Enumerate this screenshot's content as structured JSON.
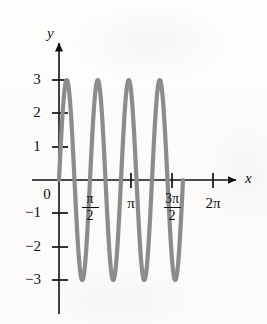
{
  "figure": {
    "background_color": "#fdfdfc",
    "curve_color": "#8c8c8c",
    "axis_color": "#111111"
  },
  "axes": {
    "x_axis_label": "x",
    "y_axis_label": "y",
    "origin_label": "0"
  },
  "y_ticks": [
    {
      "label": "3",
      "value": 3
    },
    {
      "label": "2",
      "value": 2
    },
    {
      "label": "1",
      "value": 1
    },
    {
      "label": "−1",
      "value": -1
    },
    {
      "label": "−2",
      "value": -2
    },
    {
      "label": "−3",
      "value": -3
    }
  ],
  "x_ticks": [
    {
      "numerator": "π",
      "denominator": "2",
      "label": "π/2",
      "value": 1.5708,
      "is_fraction": true
    },
    {
      "numerator": "π",
      "denominator": "",
      "label": "π",
      "value": 3.1416,
      "is_fraction": false
    },
    {
      "numerator": "3π",
      "denominator": "2",
      "label": "3π/2",
      "value": 4.7124,
      "is_fraction": true
    },
    {
      "numerator": "2π",
      "denominator": "",
      "label": "2π",
      "value": 6.2832,
      "is_fraction": false
    }
  ],
  "chart_data": {
    "type": "line",
    "title": "",
    "xlabel": "x",
    "ylabel": "y",
    "function": "y = 3 sin(4x)",
    "amplitude": 3,
    "period": 1.5708,
    "cycles_shown": 4,
    "xlim": [
      0,
      6.9
    ],
    "ylim": [
      -3.4,
      3.4
    ],
    "grid": false,
    "legend": "none",
    "xtick_labels": [
      "π/2",
      "π",
      "3π/2",
      "2π"
    ],
    "xtick_values": [
      1.5708,
      3.1416,
      4.7124,
      6.2832
    ],
    "ytick_labels": [
      "3",
      "2",
      "1",
      "−1",
      "−2",
      "−3"
    ],
    "ytick_values": [
      3,
      2,
      1,
      -1,
      -2,
      -3
    ],
    "maxima_x": [
      0.3927,
      1.9635,
      3.5343,
      5.1051
    ],
    "maxima_y": [
      3,
      3,
      3,
      3
    ],
    "minima_x": [
      1.1781,
      2.7489,
      4.3197,
      5.8905
    ],
    "minima_y": [
      -3,
      -3,
      -3,
      -3
    ],
    "zeros_x": [
      0,
      0.7854,
      1.5708,
      2.3562,
      3.1416,
      3.927,
      4.7124,
      5.4978,
      6.2832
    ],
    "series": [
      {
        "name": "y = 3 sin(4x)",
        "color": "#8c8c8c",
        "x": [
          0,
          0.1309,
          0.2618,
          0.3927,
          0.5236,
          0.6545,
          0.7854,
          0.9163,
          1.0472,
          1.1781,
          1.309,
          1.4399,
          1.5708,
          1.7017,
          1.8326,
          1.9635,
          2.0944,
          2.2253,
          2.3562,
          2.4871,
          2.618,
          2.7489,
          2.8798,
          3.0107,
          3.1416,
          3.2725,
          3.4034,
          3.5343,
          3.6652,
          3.7961,
          3.927,
          4.0579,
          4.1888,
          4.3197,
          4.4506,
          4.5815,
          4.7124,
          4.8433,
          4.9742,
          5.1051,
          5.236,
          5.3669,
          5.4978,
          5.6287,
          5.7596,
          5.8905,
          6.0214,
          6.1523,
          6.2832
        ],
        "y": [
          0,
          1.5,
          2.598,
          3,
          2.598,
          1.5,
          0,
          -1.5,
          -2.598,
          -3,
          -2.598,
          -1.5,
          0,
          1.5,
          2.598,
          3,
          2.598,
          1.5,
          0,
          -1.5,
          -2.598,
          -3,
          -2.598,
          -1.5,
          0,
          1.5,
          2.598,
          3,
          2.598,
          1.5,
          0,
          -1.5,
          -2.598,
          -3,
          -2.598,
          -1.5,
          0,
          1.5,
          2.598,
          3,
          2.598,
          1.5,
          0,
          -1.5,
          -2.598,
          -3,
          -2.598,
          -1.5,
          0
        ]
      }
    ]
  }
}
